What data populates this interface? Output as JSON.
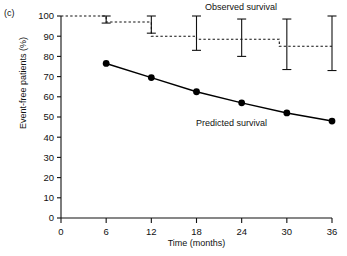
{
  "panel": {
    "label": "(c)"
  },
  "chart_data": {
    "type": "line",
    "title": "",
    "subtitle": "",
    "xlabel": "Time (months)",
    "ylabel": "Event-free patients (%)",
    "xlim": [
      0,
      36
    ],
    "ylim": [
      0,
      100
    ],
    "xticks": [
      0,
      6,
      12,
      18,
      24,
      30,
      36
    ],
    "yticks": [
      0,
      10,
      20,
      30,
      40,
      50,
      60,
      70,
      80,
      90,
      100
    ],
    "xtick_labels": [
      "0",
      "6",
      "12",
      "18",
      "24",
      "30",
      "36"
    ],
    "ytick_labels": [
      "0",
      "10",
      "20",
      "30",
      "40",
      "50",
      "60",
      "70",
      "80",
      "90",
      "100"
    ],
    "grid": false,
    "legend": "inline-annotations",
    "annotations": [
      {
        "name": "observed-survival-label",
        "text": "Observed survival",
        "x": 26,
        "y": 101
      },
      {
        "name": "predicted-survival-label",
        "text": "Predicted survival",
        "x": 21,
        "y": 48
      }
    ],
    "series": [
      {
        "name": "Observed survival",
        "style": "dashed-step",
        "marker": "none",
        "color": "#111111",
        "step_x": [
          0,
          6,
          12,
          18,
          24,
          29,
          36
        ],
        "step_y": [
          100,
          97,
          90,
          88.5,
          88.5,
          85,
          85
        ],
        "x": [
          6,
          12,
          18,
          24,
          30,
          36
        ],
        "values": [
          97,
          97,
          90,
          88.5,
          85,
          85
        ],
        "errorbars": [
          {
            "x": 6,
            "lower": 96.5,
            "upper": 100.0
          },
          {
            "x": 12,
            "lower": 91.5,
            "upper": 100.0
          },
          {
            "x": 18,
            "lower": 83.0,
            "upper": 100.0
          },
          {
            "x": 24,
            "lower": 80.0,
            "upper": 98.5
          },
          {
            "x": 30,
            "lower": 73.5,
            "upper": 98.5
          },
          {
            "x": 36,
            "lower": 73.0,
            "upper": 100.0
          }
        ]
      },
      {
        "name": "Predicted survival",
        "style": "solid",
        "marker": "filled-circle",
        "color": "#000000",
        "x": [
          6,
          12,
          18,
          24,
          30,
          36
        ],
        "values": [
          76.5,
          69.5,
          62.5,
          57.0,
          52.0,
          48.0
        ]
      }
    ]
  }
}
